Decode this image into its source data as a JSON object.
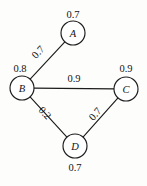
{
  "figure": {
    "background_color": "#fdfdfc",
    "ink_color": "#1c1c1c"
  },
  "chart_data": {
    "type": "diagram",
    "diagram_kind": "undirected-weighted-graph",
    "title": "",
    "nodes": [
      {
        "id": "A",
        "label": "A",
        "weight": "0.7",
        "cx": 73,
        "cy": 33,
        "r": 12,
        "weight_x": 73,
        "weight_y": 14
      },
      {
        "id": "B",
        "label": "B",
        "weight": "0.8",
        "cx": 22,
        "cy": 88,
        "r": 12,
        "weight_x": 20,
        "weight_y": 68
      },
      {
        "id": "C",
        "label": "C",
        "weight": "0.9",
        "cx": 126,
        "cy": 89,
        "r": 12,
        "weight_x": 126,
        "weight_y": 68
      },
      {
        "id": "D",
        "label": "D",
        "weight": "0.7",
        "cx": 75,
        "cy": 146,
        "r": 12,
        "weight_x": 75,
        "weight_y": 167
      }
    ],
    "edges": [
      {
        "id": "B-A",
        "source": "B",
        "target": "A",
        "weight": "0.7",
        "label_x": 38,
        "label_y": 52,
        "label_rotation": -47
      },
      {
        "id": "B-C",
        "source": "B",
        "target": "C",
        "weight": "0.9",
        "label_x": 74,
        "label_y": 78,
        "label_rotation": 0
      },
      {
        "id": "B-D",
        "source": "B",
        "target": "D",
        "weight": "0.2",
        "label_x": 45,
        "label_y": 113,
        "label_rotation": 47
      },
      {
        "id": "D-C",
        "source": "D",
        "target": "C",
        "weight": "0.7",
        "label_x": 95,
        "label_y": 114,
        "label_rotation": -48
      }
    ],
    "node_weight_values": [
      0.7,
      0.8,
      0.9,
      0.7
    ],
    "edge_weight_values": [
      0.7,
      0.9,
      0.2,
      0.7
    ]
  }
}
